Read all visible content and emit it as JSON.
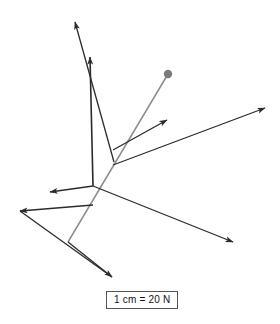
{
  "figure": {
    "background_color": "#ffffff",
    "width": 280,
    "height": 324
  },
  "scale_legend": {
    "name": "scale-legend",
    "text": "1 cm = 20 N",
    "value": 1,
    "unit_length": "cm",
    "equals": 20,
    "unit_force": "N",
    "border_color": "#555555",
    "text_color": "#111111"
  },
  "pivot": {
    "name": "pivot-dot",
    "x": 168,
    "y": 74,
    "radius": 4.2,
    "color": "#7a7a7a"
  },
  "junctions": [
    {
      "name": "main-junction",
      "x": 93,
      "y": 186
    },
    {
      "name": "upper-junction",
      "x": 114,
      "y": 162
    }
  ],
  "chart_data": {
    "type": "scatter",
    "xlabel": "",
    "ylabel": "",
    "xlim": [
      0,
      280
    ],
    "ylim": [
      0,
      324
    ],
    "grid": false,
    "legend": "bottom-center",
    "scale": "1 cm = 20 N",
    "origin": {
      "x": 93,
      "y": 186
    },
    "vectors": [
      {
        "name": "vector-up-left-long",
        "label": "",
        "color": "#2b2b2b",
        "width": 1.3,
        "x1": 114,
        "y1": 162,
        "x2": 75,
        "y2": 22,
        "arrow": "end",
        "length_px": 145.3
      },
      {
        "name": "vector-up-vertical",
        "label": "",
        "color": "#2b2b2b",
        "width": 1.6,
        "x1": 93,
        "y1": 186,
        "x2": 90,
        "y2": 57,
        "arrow": "end",
        "length_px": 129.0
      },
      {
        "name": "vector-right-far",
        "label": "",
        "color": "#2b2b2b",
        "width": 1.3,
        "x1": 113,
        "y1": 165,
        "x2": 265,
        "y2": 108,
        "arrow": "end",
        "length_px": 162.3
      },
      {
        "name": "vector-right-mid",
        "label": "",
        "color": "#2b2b2b",
        "width": 1.3,
        "x1": 113,
        "y1": 150,
        "x2": 167,
        "y2": 120,
        "arrow": "end",
        "length_px": 61.8
      },
      {
        "name": "vector-lower-right",
        "label": "",
        "color": "#2b2b2b",
        "width": 1.3,
        "x1": 93,
        "y1": 186,
        "x2": 233,
        "y2": 242,
        "arrow": "end",
        "length_px": 150.8
      },
      {
        "name": "vector-left",
        "label": "",
        "color": "#2b2b2b",
        "width": 1.3,
        "x1": 93,
        "y1": 186,
        "x2": 50,
        "y2": 192,
        "arrow": "end",
        "length_px": 43.4
      },
      {
        "name": "vector-lower-left",
        "label": "",
        "color": "#2b2b2b",
        "width": 1.3,
        "x1": 93,
        "y1": 205,
        "x2": 20,
        "y2": 211,
        "arrow": "end",
        "length_px": 73.2
      },
      {
        "name": "vector-down",
        "label": "",
        "color": "#2b2b2b",
        "width": 1.3,
        "x1": 68,
        "y1": 242,
        "x2": 112,
        "y2": 277,
        "arrow": "end",
        "length_px": 56.2
      }
    ],
    "lines": [
      {
        "name": "pivot-rod",
        "label": "",
        "color": "#8c8c8c",
        "width": 1.5,
        "x1": 168,
        "y1": 74,
        "x2": 68,
        "y2": 242,
        "arrow": "none"
      },
      {
        "name": "lower-left-segment",
        "label": "",
        "color": "#2b2b2b",
        "width": 1.3,
        "x1": 20,
        "y1": 211,
        "x2": 112,
        "y2": 277,
        "arrow": "none"
      }
    ]
  }
}
